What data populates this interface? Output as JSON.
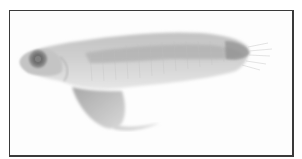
{
  "image": {
    "subject": "larval fish specimen",
    "description": "Grayscale photograph of a larval fish, lateral view, head to the left, with a large yolk sac below the body, framed by a thin dark border",
    "colors": {
      "background": "#fdfdfd",
      "border": "#3a3a3a",
      "body": "#c9c9c9",
      "body_dark": "#9a9a9a",
      "eye": "#7a7a7a"
    }
  }
}
